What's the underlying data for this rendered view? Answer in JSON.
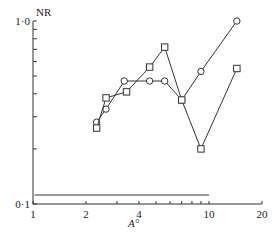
{
  "chart_data": {
    "type": "line",
    "title": "",
    "xlabel": "A°",
    "ylabel": "NR",
    "xscale": "log",
    "yscale": "log",
    "xlim": [
      1,
      20
    ],
    "ylim": [
      0.1,
      1.0
    ],
    "x_ticks": [
      "1",
      "2",
      "4",
      "10",
      "20"
    ],
    "y_ticks": [
      "0·1",
      "1·0"
    ],
    "grid": false,
    "legend": null,
    "series": [
      {
        "name": "circles",
        "marker": "circle",
        "x": [
          2.3,
          2.6,
          3.3,
          4.6,
          5.6,
          7.0,
          9.0,
          14.4
        ],
        "y": [
          0.28,
          0.33,
          0.47,
          0.47,
          0.47,
          0.37,
          0.53,
          1.0
        ]
      },
      {
        "name": "squares",
        "marker": "square",
        "x": [
          2.3,
          2.6,
          3.4,
          4.6,
          5.6,
          7.0,
          9.0,
          14.4
        ],
        "y": [
          0.26,
          0.38,
          0.41,
          0.56,
          0.72,
          0.37,
          0.2,
          0.55
        ]
      },
      {
        "name": "baseline",
        "marker": "none",
        "x": [
          1.02,
          10
        ],
        "y": [
          0.112,
          0.112
        ]
      }
    ]
  }
}
